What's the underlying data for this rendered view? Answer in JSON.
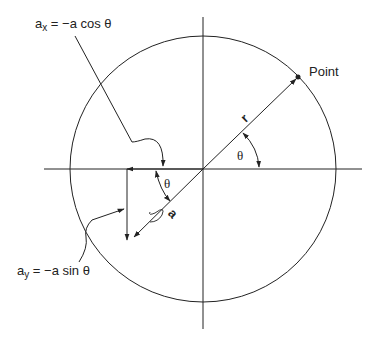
{
  "diagram": {
    "labels": {
      "ax_equation_main": "a",
      "ax_equation_sub": "x",
      "ax_equation_rest": " = −a cos θ",
      "ay_equation_main": "a",
      "ay_equation_sub": "y",
      "ay_equation_rest": " = −a sin θ",
      "point": "Point",
      "radius_vector": "r",
      "acceleration_vector": "a",
      "theta_upper": "θ",
      "theta_lower": "θ"
    },
    "colors": {
      "stroke": "#222222",
      "background": "#ffffff"
    }
  }
}
